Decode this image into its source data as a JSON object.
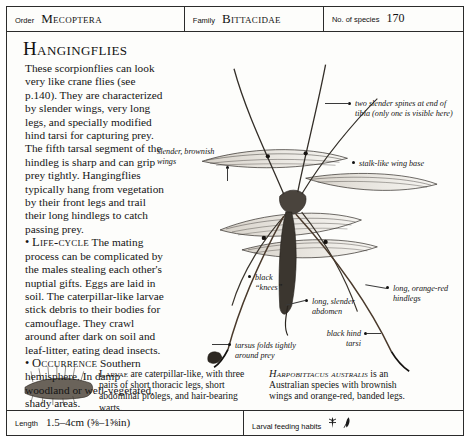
{
  "header": {
    "order_label": "Order",
    "order_value": "Mecoptera",
    "family_label": "Family",
    "family_value": "Bittacidae",
    "species_label": "No. of species",
    "species_value": "170"
  },
  "article": {
    "title": "Hangingflies",
    "intro": "These scorpionflies can look very like crane flies (see p.140). They are characterized by slender wings, very long legs, and specially modified hind tarsi for capturing prey. The fifth tarsal segment of the hindleg is sharp and can grip prey tightly. Hangingflies typically hang from vegetation by their front legs and trail their long hindlegs to catch passing prey.",
    "bullet_symbol": "•",
    "lifecycle_heading": "Life-cycle",
    "lifecycle_text": " The mating process can be complicated by the males stealing each other's nuptial gifts. Eggs are laid in soil. The caterpillar-like larvae stick debris to their bodies for camouflage. They crawl around after dark on soil and leaf-litter, eating dead insects.",
    "occurrence_heading": "Occurrence",
    "occurrence_text": " Southern hemisphere. In damp woodland or well-vegetated, shady areas."
  },
  "annotations": [
    {
      "id": "spines",
      "text": "two slender spines at end of tibia (only one is visible here)"
    },
    {
      "id": "wings",
      "text": "slender, brownish wings"
    },
    {
      "id": "wing-base",
      "text": "stalk-like wing base"
    },
    {
      "id": "knees",
      "text": "black “knees”"
    },
    {
      "id": "abdomen",
      "text": "long, slender abdomen"
    },
    {
      "id": "hindlegs",
      "text": "long, orange-red hindlegs"
    },
    {
      "id": "hind-tarsi",
      "text": "black hind tarsi"
    },
    {
      "id": "tarsus",
      "text": "tarsus folds tightly around prey"
    }
  ],
  "captions": {
    "larvae_lead": "Larvae",
    "larvae_text": " are caterpillar-like, with three pairs of short thoracic legs, short abdominal prolegs, and hair-bearing warts.",
    "species_lead": "Harpobittacus australis",
    "species_text": " is an Australian species with brownish wings and orange-red, banded legs."
  },
  "footer": {
    "length_label": "Length",
    "length_value": "1.5–4cm (⅝–1⅝in)",
    "habits_label": "Larval feeding habits",
    "icon_one": "larva-icon",
    "icon_two": "leaf-litter-icon"
  }
}
